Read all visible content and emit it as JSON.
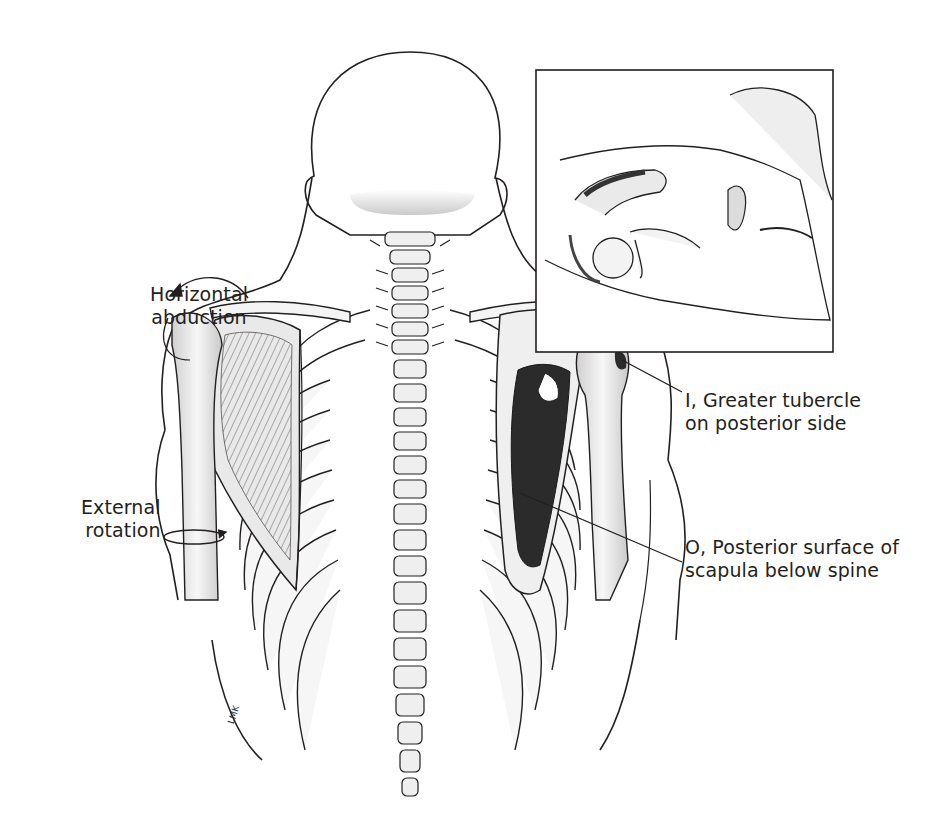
{
  "figure": {
    "colors": {
      "background": "#ffffff",
      "line": "#231f20",
      "muscle_fill": "#2b2b2b",
      "bone_fill": "#f2f2f2",
      "shade": "#bdbdbd"
    }
  },
  "labels": {
    "horizontal_abduction": {
      "line1": "Horizontal",
      "line2": "abduction"
    },
    "external_rotation": {
      "line1": "External",
      "line2": "rotation"
    },
    "insertion": {
      "line1": "I, Greater tubercle",
      "line2": "on posterior side"
    },
    "origin": {
      "line1": "O, Posterior surface of",
      "line2": "scapula below spine"
    }
  },
  "inset": {
    "description": "Prone figure showing shoulder with infraspinatus, head turned to side"
  },
  "signature": "LMK"
}
